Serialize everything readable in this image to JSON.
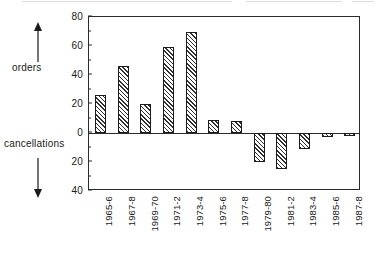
{
  "axis": {
    "orders_label": "orders",
    "cancellations_label": "cancellations",
    "orders_arrow_icon": "arrow-up-icon",
    "cancellations_arrow_icon": "arrow-down-icon"
  },
  "chart_data": {
    "type": "bar",
    "title": "",
    "subtitle": "",
    "xlabel": "",
    "ylabel": "",
    "orientation": "vertical",
    "diverging": true,
    "grid": false,
    "legend": null,
    "ylim": [
      -40,
      80
    ],
    "yticks": [
      80,
      60,
      40,
      20,
      0,
      20,
      40
    ],
    "ytick_values_signed": [
      80,
      60,
      40,
      20,
      0,
      -20,
      -40
    ],
    "ytick_labels": [
      "80",
      "60",
      "40",
      "20",
      "0",
      "20",
      "40"
    ],
    "above_axis_meaning": "orders",
    "below_axis_meaning": "cancellations",
    "categories": [
      "1965-6",
      "1967-8",
      "1969-70",
      "1971-2",
      "1973-4",
      "1975-6",
      "1977-8",
      "1979-80",
      "1981-2",
      "1983-4",
      "1985-6",
      "1987-8"
    ],
    "series": [
      {
        "name": "orders",
        "values": [
          26,
          46,
          20,
          59,
          70,
          9,
          8,
          0,
          0,
          0,
          0,
          0
        ]
      },
      {
        "name": "cancellations",
        "values": [
          0,
          0,
          0,
          4,
          3,
          21,
          23,
          20,
          25,
          11,
          3,
          2
        ]
      }
    ],
    "net_values": [
      26,
      46,
      20,
      59,
      70,
      9,
      8,
      -20,
      -25,
      -11,
      -3,
      -2
    ],
    "bar_style": "diagonal-hatch",
    "bar_fill_hex": "#ffffff",
    "bar_hatch_hex": "#2f2f2f",
    "bar_edge_hex": "#1c1c1c",
    "axis_hex": "#2b2b2b"
  }
}
